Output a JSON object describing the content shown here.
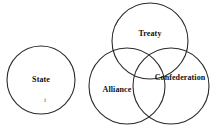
{
  "diagram": {
    "type": "venn",
    "background_color": "#ffffff",
    "stroke_color": "#2b2b2b",
    "text_color": "#111111",
    "groups": [
      {
        "name": "standalone",
        "circles": [
          {
            "id": "state",
            "label": "State",
            "cx": 41,
            "cy": 80,
            "r": 34
          }
        ]
      },
      {
        "name": "venn-three-set",
        "circles": [
          {
            "id": "treaty",
            "label": "Treaty",
            "cx": 150,
            "cy": 41,
            "r": 38
          },
          {
            "id": "alliance",
            "label": "Alliance",
            "cx": 127,
            "cy": 86,
            "r": 38
          },
          {
            "id": "confederation",
            "label": "Confederation",
            "cx": 171,
            "cy": 86,
            "r": 38
          }
        ]
      }
    ],
    "annotations": [
      {
        "id": "state-sub-mark",
        "text": "t",
        "x": 45,
        "y": 100,
        "style": "italic"
      }
    ]
  },
  "labels": {
    "state": "State",
    "treaty": "Treaty",
    "alliance": "Alliance",
    "confederation": "Confederation",
    "state_sub_mark": "t"
  }
}
